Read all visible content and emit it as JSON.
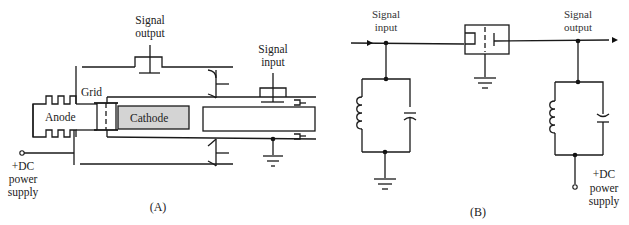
{
  "figure": {
    "panel_a": {
      "caption": "(A)",
      "labels": {
        "signal_output": [
          "Signal",
          "output"
        ],
        "signal_input": [
          "Signal",
          "input"
        ],
        "grid": "Grid",
        "anode": "Anode",
        "cathode": "Cathode",
        "power": [
          "+DC",
          "power",
          "supply"
        ]
      },
      "colors": {
        "cathode_fill": "#d4d4d4"
      }
    },
    "panel_b": {
      "caption": "(B)",
      "labels": {
        "signal_input": [
          "Signal",
          "input"
        ],
        "signal_output": [
          "Signal",
          "output"
        ],
        "power": [
          "+DC",
          "power",
          "supply"
        ]
      }
    }
  }
}
